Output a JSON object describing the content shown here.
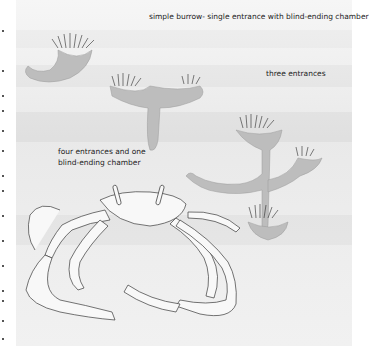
{
  "figure": {
    "labels": {
      "simple": "simple burrow- single entrance with blind-ending chamber",
      "three": "three entrances",
      "four_line1": "four entrances and one",
      "four_line2": "blind-ending chamber"
    },
    "colors": {
      "background": "#ffffff",
      "sediment": "#ececec",
      "burrow_fill": "#b9b9b9",
      "ink": "#333333"
    }
  }
}
